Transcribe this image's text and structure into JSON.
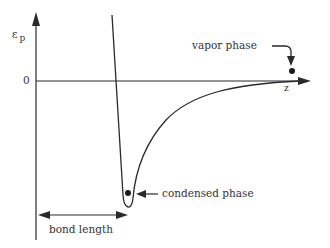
{
  "diagram": {
    "y_axis_label": "ε",
    "y_axis_subscript": "p",
    "x_axis_label": "z",
    "zero_label": "0",
    "annotations": {
      "vapor_phase": "vapor phase",
      "condensed_phase": "condensed phase",
      "bond_length": "bond length"
    },
    "colors": {
      "line": "#2a2a2a",
      "background": "#ffffff"
    }
  }
}
